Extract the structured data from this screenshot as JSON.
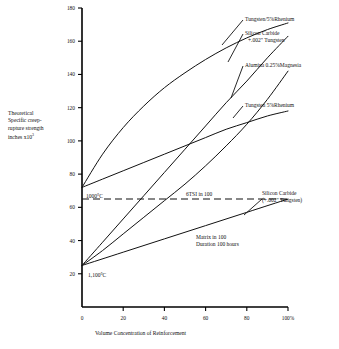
{
  "chart_data": {
    "type": "line",
    "title": "",
    "xlabel": "Volume Concentration of Reinforcement",
    "ylabel_lines": [
      "Theoretical",
      "Specific creep-",
      "rupture strength",
      "inches x10"
    ],
    "ylabel_exponent": "3",
    "xlim": [
      0,
      100
    ],
    "ylim": [
      0,
      180
    ],
    "xticks": [
      0,
      20,
      40,
      60,
      80,
      100
    ],
    "xticklabels": [
      "0",
      "20",
      "40",
      "60",
      "80",
      "100%"
    ],
    "yticks": [
      20,
      40,
      60,
      80,
      100,
      120,
      140,
      160,
      180
    ],
    "yticklabels": [
      "20",
      "40",
      "60",
      "80",
      "100",
      "120",
      "140",
      "160",
      "180"
    ],
    "grid": false,
    "legend_position": "inline-annotations",
    "reference_line": {
      "label": "6TSI in 100",
      "y": 65,
      "style": "dashed"
    },
    "group_origins": [
      {
        "label": "1000°C",
        "x": 0,
        "y": 72
      },
      {
        "label": "1,100°C",
        "x": 0,
        "y": 25
      }
    ],
    "series": [
      {
        "name": "Tungsten/5%Rhenium",
        "origin": "1000°C",
        "x": [
          0,
          10,
          20,
          30,
          40,
          50,
          60,
          70,
          80,
          90,
          100
        ],
        "values": [
          72,
          92,
          108,
          121,
          132,
          141,
          149,
          156,
          162,
          167,
          171
        ]
      },
      {
        "name": "Silicon Carbide +.002\" Tungsten",
        "origin": "1,100°C",
        "x": [
          0,
          10,
          20,
          30,
          40,
          50,
          60,
          70,
          80,
          90,
          100
        ],
        "values": [
          25,
          39,
          53,
          67,
          81,
          95,
          109,
          123,
          136,
          150,
          163
        ]
      },
      {
        "name": "Alumina 0.25%Magnesia",
        "origin": "1,100°C",
        "x": [
          0,
          10,
          20,
          30,
          40,
          50,
          60,
          70,
          80,
          90,
          100
        ],
        "values": [
          25,
          34,
          44,
          54,
          64,
          74,
          85,
          97,
          110,
          125,
          142
        ]
      },
      {
        "name": "Tungsten 5%Rhenium",
        "origin": "1000°C",
        "x": [
          0,
          10,
          20,
          30,
          40,
          50,
          60,
          70,
          80,
          90,
          100
        ],
        "values": [
          72,
          77,
          82,
          87,
          92,
          97,
          102,
          107,
          111,
          115,
          118
        ]
      },
      {
        "name": "Silicon Carbide (+.002\" Tungsten)",
        "origin": "1,100°C",
        "x": [
          0,
          20,
          40,
          60,
          80,
          100
        ],
        "values": [
          25,
          33,
          41,
          49,
          57,
          65
        ]
      }
    ],
    "annotations": [
      {
        "text": "Tungsten/5%Rhenium",
        "id": "tungsten-rhenium-upper"
      },
      {
        "text": "Silicon Carbide",
        "id": "silicon-carbide-line1"
      },
      {
        "text": "+.002\" Tungsten",
        "id": "silicon-carbide-line2"
      },
      {
        "text": "Alumina 0.25%Magnesia",
        "id": "alumina-magnesia"
      },
      {
        "text": "Tungsten 5%Rhenium",
        "id": "tungsten-rhenium-lower"
      },
      {
        "text": "6TSI in 100",
        "id": "reference-line-label"
      },
      {
        "text": "Silicon Carbide",
        "id": "silicon-carbide-low-line1"
      },
      {
        "text": "(+.002\" Tungsten)",
        "id": "silicon-carbide-low-line2"
      },
      {
        "text": "Matrix in 100",
        "id": "matrix-note-line1"
      },
      {
        "text": "Duration 100 hours",
        "id": "matrix-note-line2"
      },
      {
        "text": "1000°C",
        "id": "temp-1000"
      },
      {
        "text": "1,100°C",
        "id": "temp-1100"
      }
    ]
  }
}
